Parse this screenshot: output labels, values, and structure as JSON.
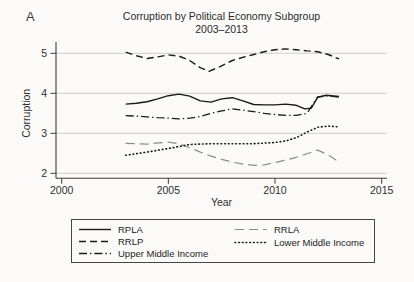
{
  "panel_label": "A",
  "chart_data": {
    "type": "line",
    "title": "Corruption by Political Economy Subgroup",
    "subtitle": "2003–2013",
    "xlabel": "Year",
    "ylabel": "Corruption",
    "xlim": [
      2000,
      2015
    ],
    "ylim": [
      2,
      5.25
    ],
    "xticks": [
      2000,
      2005,
      2010,
      2015
    ],
    "yticks": [
      5,
      4,
      3,
      2
    ],
    "grid": "horizontal",
    "legend_position": "bottom-box-two-columns",
    "colors": {
      "black_series": "#1a1a1a",
      "gray_series": "#8c8c8c",
      "gridline": "#c9c9c9",
      "axis": "#3c3c3c",
      "background": "#fbfaf8"
    },
    "series": [
      {
        "name": "RPLA",
        "dash": "solid",
        "color": "#1a1a1a",
        "width": 1.4,
        "points": [
          [
            2003,
            3.73
          ],
          [
            2003.5,
            3.75
          ],
          [
            2004,
            3.79
          ],
          [
            2004.5,
            3.86
          ],
          [
            2005,
            3.94
          ],
          [
            2005.5,
            3.98
          ],
          [
            2006,
            3.93
          ],
          [
            2006.5,
            3.81
          ],
          [
            2007,
            3.78
          ],
          [
            2007.5,
            3.86
          ],
          [
            2008,
            3.89
          ],
          [
            2008.5,
            3.81
          ],
          [
            2009,
            3.72
          ],
          [
            2009.5,
            3.71
          ],
          [
            2010,
            3.71
          ],
          [
            2010.5,
            3.73
          ],
          [
            2011,
            3.7
          ],
          [
            2011.4,
            3.61
          ],
          [
            2011.7,
            3.63
          ],
          [
            2012,
            3.9
          ],
          [
            2012.4,
            3.95
          ],
          [
            2013,
            3.92
          ]
        ]
      },
      {
        "name": "RRLP",
        "dash": "dash",
        "color": "#1a1a1a",
        "width": 1.4,
        "points": [
          [
            2003,
            5.03
          ],
          [
            2003.5,
            4.94
          ],
          [
            2004,
            4.87
          ],
          [
            2004.5,
            4.91
          ],
          [
            2005,
            4.96
          ],
          [
            2005.5,
            4.93
          ],
          [
            2006,
            4.82
          ],
          [
            2006.5,
            4.64
          ],
          [
            2006.9,
            4.55
          ],
          [
            2007.4,
            4.66
          ],
          [
            2008,
            4.82
          ],
          [
            2008.5,
            4.9
          ],
          [
            2009,
            4.97
          ],
          [
            2009.5,
            5.04
          ],
          [
            2010,
            5.09
          ],
          [
            2010.5,
            5.11
          ],
          [
            2011,
            5.09
          ],
          [
            2011.5,
            5.06
          ],
          [
            2012,
            5.04
          ],
          [
            2012.5,
            4.97
          ],
          [
            2013,
            4.86
          ]
        ]
      },
      {
        "name": "Upper Middle Income",
        "dash": "dashdot",
        "color": "#1a1a1a",
        "width": 1.3,
        "points": [
          [
            2003,
            3.44
          ],
          [
            2003.5,
            3.43
          ],
          [
            2004,
            3.41
          ],
          [
            2004.5,
            3.39
          ],
          [
            2005,
            3.38
          ],
          [
            2005.5,
            3.36
          ],
          [
            2006,
            3.38
          ],
          [
            2006.5,
            3.42
          ],
          [
            2007,
            3.5
          ],
          [
            2007.5,
            3.56
          ],
          [
            2008,
            3.61
          ],
          [
            2008.5,
            3.58
          ],
          [
            2009,
            3.54
          ],
          [
            2009.5,
            3.5
          ],
          [
            2010,
            3.47
          ],
          [
            2010.5,
            3.45
          ],
          [
            2011,
            3.45
          ],
          [
            2011.5,
            3.5
          ],
          [
            2012,
            3.91
          ],
          [
            2012.5,
            3.94
          ],
          [
            2013,
            3.9
          ]
        ]
      },
      {
        "name": "RRLA",
        "dash": "longdash",
        "color": "#8c8c8c",
        "width": 1.2,
        "points": [
          [
            2003,
            2.75
          ],
          [
            2003.5,
            2.74
          ],
          [
            2004,
            2.73
          ],
          [
            2004.5,
            2.76
          ],
          [
            2005,
            2.78
          ],
          [
            2005.5,
            2.74
          ],
          [
            2006,
            2.64
          ],
          [
            2006.5,
            2.53
          ],
          [
            2007,
            2.43
          ],
          [
            2007.5,
            2.35
          ],
          [
            2008,
            2.28
          ],
          [
            2008.5,
            2.23
          ],
          [
            2009,
            2.2
          ],
          [
            2009.5,
            2.21
          ],
          [
            2010,
            2.27
          ],
          [
            2010.5,
            2.33
          ],
          [
            2011,
            2.4
          ],
          [
            2011.5,
            2.49
          ],
          [
            2012,
            2.58
          ],
          [
            2012.5,
            2.46
          ],
          [
            2013,
            2.28
          ]
        ]
      },
      {
        "name": "Lower Middle Income",
        "dash": "dot",
        "color": "#1a1a1a",
        "width": 1.6,
        "points": [
          [
            2003,
            2.45
          ],
          [
            2004,
            2.53
          ],
          [
            2005,
            2.62
          ],
          [
            2005.5,
            2.67
          ],
          [
            2006,
            2.72
          ],
          [
            2006.5,
            2.73
          ],
          [
            2007,
            2.74
          ],
          [
            2008,
            2.74
          ],
          [
            2009,
            2.74
          ],
          [
            2010,
            2.77
          ],
          [
            2010.5,
            2.81
          ],
          [
            2011,
            2.89
          ],
          [
            2011.5,
            3.03
          ],
          [
            2012,
            3.15
          ],
          [
            2012.5,
            3.18
          ],
          [
            2013,
            3.16
          ]
        ]
      }
    ],
    "legend_columns": [
      [
        0,
        1,
        2
      ],
      [
        3,
        4
      ]
    ]
  }
}
